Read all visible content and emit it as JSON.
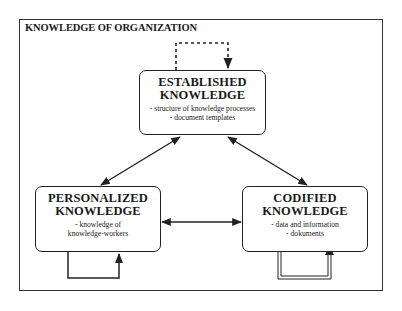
{
  "diagram": {
    "title": "KNOWLEDGE OF ORGANIZATION",
    "nodes": [
      {
        "id": "established",
        "title_line1": "ESTABLISHED",
        "title_line2": "KNOWLEDGE",
        "desc_line1": "- structure of knowledge processes",
        "desc_line2": "- document templates"
      },
      {
        "id": "personalized",
        "title_line1": "PERSONALIZED",
        "title_line2": "KNOWLEDGE",
        "desc_line1": "- knowledge of",
        "desc_line2": "knowledge-workers"
      },
      {
        "id": "codified",
        "title_line1": "CODIFIED",
        "title_line2": "KNOWLEDGE",
        "desc_line1": "- data and information",
        "desc_line2": "- dokuments"
      }
    ],
    "edges": [
      {
        "from": "established",
        "to": "personalized",
        "style": "solid",
        "direction": "both"
      },
      {
        "from": "established",
        "to": "codified",
        "style": "solid",
        "direction": "both"
      },
      {
        "from": "personalized",
        "to": "codified",
        "style": "solid",
        "direction": "both"
      },
      {
        "from": "established",
        "to": "established",
        "style": "dashed",
        "direction": "self-loop"
      },
      {
        "from": "personalized",
        "to": "personalized",
        "style": "solid",
        "direction": "self-loop"
      },
      {
        "from": "codified",
        "to": "codified",
        "style": "double",
        "direction": "self-loop"
      }
    ],
    "colors": {
      "line": "#222222",
      "background": "#ffffff"
    }
  }
}
